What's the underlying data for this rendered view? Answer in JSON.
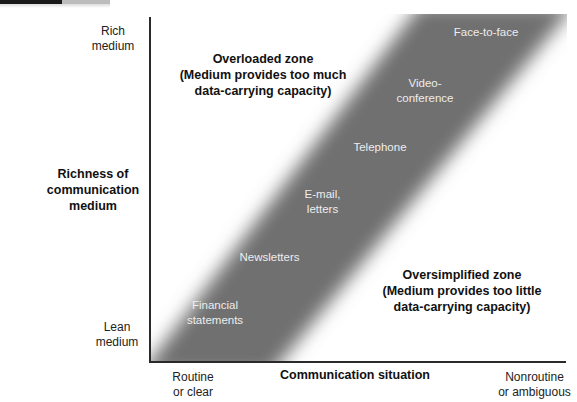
{
  "diagram": {
    "y_axis": {
      "title_lines": [
        "Richness of",
        "communication",
        "medium"
      ],
      "top_label_lines": [
        "Rich",
        "medium"
      ],
      "bottom_label_lines": [
        "Lean",
        "medium"
      ]
    },
    "x_axis": {
      "title": "Communication situation",
      "left_label_lines": [
        "Routine",
        "or clear"
      ],
      "right_label_lines": [
        "Nonroutine",
        "or ambiguous"
      ]
    },
    "zones": {
      "overloaded": {
        "title": "Overloaded zone",
        "desc_lines": [
          "(Medium provides too much",
          "data-carrying capacity)"
        ]
      },
      "oversimplified": {
        "title": "Oversimplified zone",
        "desc_lines": [
          "(Medium provides too little",
          "data-carrying capacity)"
        ]
      }
    },
    "media": [
      {
        "lines": [
          "Face-to-face"
        ]
      },
      {
        "lines": [
          "Video-",
          "conference"
        ]
      },
      {
        "lines": [
          "Telephone"
        ]
      },
      {
        "lines": [
          "E-mail,",
          "letters"
        ]
      },
      {
        "lines": [
          "Newsletters"
        ]
      },
      {
        "lines": [
          "Financial",
          "statements"
        ]
      }
    ],
    "colors": {
      "band": "#6f6f6f",
      "axis": "#2a2a2a",
      "band_text": "#ededed"
    }
  }
}
